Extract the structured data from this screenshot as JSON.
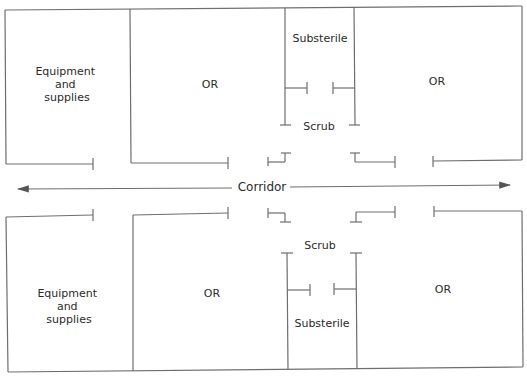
{
  "diagram": {
    "type": "floor-plan",
    "corridor": {
      "label": "Corridor",
      "direction": "bidirectional"
    },
    "top_row": {
      "rooms": [
        {
          "id": "equip-top",
          "label_lines": [
            "Equipment",
            "and",
            "supplies"
          ]
        },
        {
          "id": "or-top-left",
          "label": "OR"
        },
        {
          "id": "substerile-top",
          "label": "Substerile"
        },
        {
          "id": "scrub-top",
          "label": "Scrub"
        },
        {
          "id": "or-top-right",
          "label": "OR"
        }
      ]
    },
    "bottom_row": {
      "rooms": [
        {
          "id": "equip-bottom",
          "label_lines": [
            "Equipment",
            "and",
            "supplies"
          ]
        },
        {
          "id": "or-bottom-left",
          "label": "OR"
        },
        {
          "id": "scrub-bottom",
          "label": "Scrub"
        },
        {
          "id": "substerile-bottom",
          "label": "Substerile"
        },
        {
          "id": "or-bottom-right",
          "label": "OR"
        }
      ]
    },
    "colors": {
      "wall": "#6e6e6e",
      "text": "#2a2a2a",
      "background": "#ffffff"
    }
  }
}
